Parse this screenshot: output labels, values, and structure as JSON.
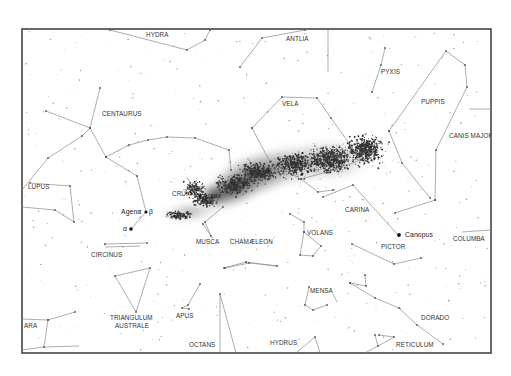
{
  "map": {
    "title": "Southern sky chart",
    "frame": {
      "x": 22,
      "y": 29,
      "width": 469,
      "height": 324
    },
    "colors": {
      "frame": "#444444",
      "constellation_line": "#8a8a8a",
      "label": "#333333",
      "milky_way": "#2a2a2a",
      "background": "#ffffff"
    },
    "constellation_labels": [
      {
        "id": "hydra",
        "text": "HYDRA",
        "x": 146,
        "y": 37
      },
      {
        "id": "antlia",
        "text": "ANTLIA",
        "x": 286,
        "y": 41
      },
      {
        "id": "pyxis",
        "text": "PYXIS",
        "x": 381,
        "y": 74
      },
      {
        "id": "puppis",
        "text": "PUPPIS",
        "x": 421,
        "y": 104
      },
      {
        "id": "centaurus",
        "text": "CENTAURUS",
        "x": 102,
        "y": 116
      },
      {
        "id": "vela",
        "text": "VELA",
        "x": 282,
        "y": 106
      },
      {
        "id": "canis-major",
        "text": "CANIS MAJOR",
        "x": 449,
        "y": 138
      },
      {
        "id": "lupus",
        "text": "LUPUS",
        "x": 28,
        "y": 189
      },
      {
        "id": "crux",
        "text": "CRUX",
        "x": 172,
        "y": 196
      },
      {
        "id": "carina",
        "text": "CARINA",
        "x": 345,
        "y": 212
      },
      {
        "id": "volans",
        "text": "VOLANS",
        "x": 307,
        "y": 235
      },
      {
        "id": "circinus",
        "text": "CIRCINUS",
        "x": 91,
        "y": 257
      },
      {
        "id": "musca",
        "text": "MUSCA",
        "x": 196,
        "y": 244
      },
      {
        "id": "chamaeleon",
        "text": "CHAMÆLEON",
        "x": 230,
        "y": 244
      },
      {
        "id": "pictor",
        "text": "PICTOR",
        "x": 381,
        "y": 249
      },
      {
        "id": "columba",
        "text": "COLUMBA",
        "x": 453,
        "y": 241
      },
      {
        "id": "mensa",
        "text": "MENSA",
        "x": 310,
        "y": 293
      },
      {
        "id": "triangulum-australe-1",
        "text": "TRIANGULUM",
        "x": 110,
        "y": 320
      },
      {
        "id": "triangulum-australe-2",
        "text": "AUSTRALE",
        "x": 115,
        "y": 328
      },
      {
        "id": "apus",
        "text": "APUS",
        "x": 176,
        "y": 318
      },
      {
        "id": "dorado",
        "text": "DORADO",
        "x": 421,
        "y": 320
      },
      {
        "id": "ara",
        "text": "ARA",
        "x": 24,
        "y": 328
      },
      {
        "id": "octans",
        "text": "OCTANS",
        "x": 189,
        "y": 347
      },
      {
        "id": "hydrus",
        "text": "HYDRUS",
        "x": 270,
        "y": 345
      },
      {
        "id": "reticulum",
        "text": "RETICULUM",
        "x": 396,
        "y": 347
      }
    ],
    "star_labels": [
      {
        "id": "agena",
        "text": "Agena",
        "x": 121,
        "y": 214
      },
      {
        "id": "beta",
        "text": "β",
        "x": 149,
        "y": 214
      },
      {
        "id": "alpha",
        "text": "α",
        "x": 123,
        "y": 231
      },
      {
        "id": "acrux",
        "text": "Acrux",
        "x": 203,
        "y": 198
      },
      {
        "id": "canopus",
        "text": "Canopus",
        "x": 405,
        "y": 237
      }
    ],
    "bright_stars": [
      {
        "name": "Agena (β Centauri)",
        "x": 146,
        "y": 212,
        "r": 1.6
      },
      {
        "name": "α Centauri",
        "x": 131,
        "y": 229,
        "r": 1.8
      },
      {
        "name": "Acrux",
        "x": 200,
        "y": 196,
        "r": 1.6
      },
      {
        "name": "Canopus",
        "x": 399,
        "y": 235,
        "r": 1.9
      }
    ]
  }
}
